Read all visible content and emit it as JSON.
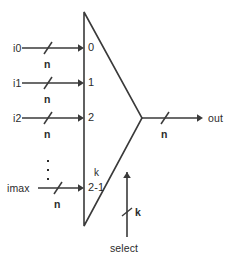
{
  "diagram": {
    "type": "multiplexer-schematic",
    "stroke_color": "#3a3a3a",
    "text_color": "#2b2b2b",
    "background_color": "#ffffff",
    "inputs": [
      {
        "signal_label": "i0",
        "width_label": "n",
        "port_label": "0"
      },
      {
        "signal_label": "i1",
        "width_label": "n",
        "port_label": "1"
      },
      {
        "signal_label": "i2",
        "width_label": "n",
        "port_label": "2"
      },
      {
        "signal_label": "imax",
        "width_label": "n",
        "port_base": "2-1",
        "port_exponent": "k"
      }
    ],
    "ellipsis": "vertical-dots",
    "output": {
      "signal_label": "out",
      "width_label": "n"
    },
    "select": {
      "signal_label": "select",
      "width_label": "k"
    }
  }
}
